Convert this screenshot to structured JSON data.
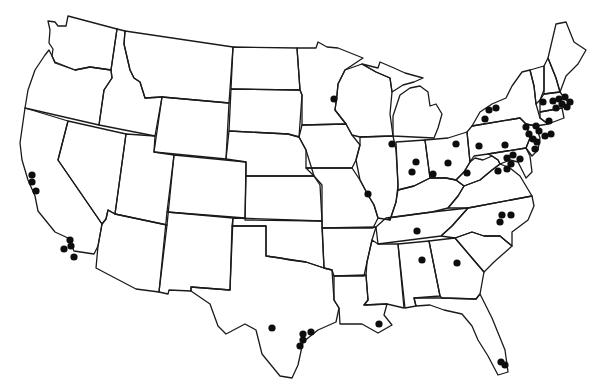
{
  "map": {
    "title": "",
    "region": "Contiguous United States",
    "style": "black-and-white state outline map",
    "line_color": "#1a1a1a",
    "dot_color": "#0d0d0d",
    "background": "#ffffff",
    "dot_radius": 3.6,
    "points": [
      {
        "state": "California",
        "x": 32,
        "y": 175
      },
      {
        "state": "California",
        "x": 32,
        "y": 182
      },
      {
        "state": "California",
        "x": 36,
        "y": 191
      },
      {
        "state": "California",
        "x": 70,
        "y": 240
      },
      {
        "state": "California",
        "x": 71,
        "y": 246
      },
      {
        "state": "California",
        "x": 64,
        "y": 249
      },
      {
        "state": "California",
        "x": 74,
        "y": 257
      },
      {
        "state": "Minnesota",
        "x": 334,
        "y": 99
      },
      {
        "state": "Illinois",
        "x": 392,
        "y": 144
      },
      {
        "state": "Missouri",
        "x": 368,
        "y": 194
      },
      {
        "state": "Indiana",
        "x": 416,
        "y": 162
      },
      {
        "state": "Indiana",
        "x": 412,
        "y": 172
      },
      {
        "state": "Indiana",
        "x": 433,
        "y": 174
      },
      {
        "state": "Ohio",
        "x": 456,
        "y": 144
      },
      {
        "state": "Ohio",
        "x": 448,
        "y": 163
      },
      {
        "state": "West Virginia",
        "x": 467,
        "y": 173
      },
      {
        "state": "New York",
        "x": 489,
        "y": 110
      },
      {
        "state": "New York",
        "x": 496,
        "y": 108
      },
      {
        "state": "New York",
        "x": 485,
        "y": 119
      },
      {
        "state": "Pennsylvania",
        "x": 479,
        "y": 146
      },
      {
        "state": "Pennsylvania",
        "x": 505,
        "y": 145
      },
      {
        "state": "Maryland",
        "x": 507,
        "y": 158
      },
      {
        "state": "Maryland",
        "x": 513,
        "y": 155
      },
      {
        "state": "Maryland",
        "x": 520,
        "y": 159
      },
      {
        "state": "Maryland",
        "x": 511,
        "y": 164
      },
      {
        "state": "Virginia",
        "x": 498,
        "y": 171
      },
      {
        "state": "Virginia",
        "x": 507,
        "y": 169
      },
      {
        "state": "New Jersey",
        "x": 526,
        "y": 127
      },
      {
        "state": "New Jersey",
        "x": 529,
        "y": 134
      },
      {
        "state": "New Jersey",
        "x": 533,
        "y": 139
      },
      {
        "state": "New Jersey",
        "x": 537,
        "y": 142
      },
      {
        "state": "New Jersey",
        "x": 535,
        "y": 149
      },
      {
        "state": "New York",
        "x": 536,
        "y": 126
      },
      {
        "state": "New York",
        "x": 539,
        "y": 131
      },
      {
        "state": "Connecticut",
        "x": 549,
        "y": 121
      },
      {
        "state": "Connecticut",
        "x": 545,
        "y": 136
      },
      {
        "state": "Connecticut",
        "x": 551,
        "y": 134
      },
      {
        "state": "Massachusetts",
        "x": 543,
        "y": 102
      },
      {
        "state": "Massachusetts",
        "x": 553,
        "y": 101
      },
      {
        "state": "Massachusetts",
        "x": 559,
        "y": 99
      },
      {
        "state": "Massachusetts",
        "x": 565,
        "y": 97
      },
      {
        "state": "Massachusetts",
        "x": 562,
        "y": 104
      },
      {
        "state": "Massachusetts",
        "x": 570,
        "y": 102
      },
      {
        "state": "Massachusetts",
        "x": 556,
        "y": 108
      },
      {
        "state": "Rhode Island",
        "x": 567,
        "y": 107
      },
      {
        "state": "Tennessee",
        "x": 417,
        "y": 231
      },
      {
        "state": "North Carolina",
        "x": 502,
        "y": 215
      },
      {
        "state": "North Carolina",
        "x": 511,
        "y": 215
      },
      {
        "state": "North Carolina",
        "x": 500,
        "y": 222
      },
      {
        "state": "Alabama",
        "x": 422,
        "y": 260
      },
      {
        "state": "Georgia",
        "x": 457,
        "y": 263
      },
      {
        "state": "Louisiana",
        "x": 379,
        "y": 324
      },
      {
        "state": "Texas",
        "x": 272,
        "y": 328
      },
      {
        "state": "Texas",
        "x": 303,
        "y": 334
      },
      {
        "state": "Texas",
        "x": 311,
        "y": 332
      },
      {
        "state": "Texas",
        "x": 300,
        "y": 346
      },
      {
        "state": "Texas",
        "x": 303,
        "y": 340
      },
      {
        "state": "Florida",
        "x": 501,
        "y": 362
      },
      {
        "state": "Florida",
        "x": 505,
        "y": 365
      }
    ]
  }
}
